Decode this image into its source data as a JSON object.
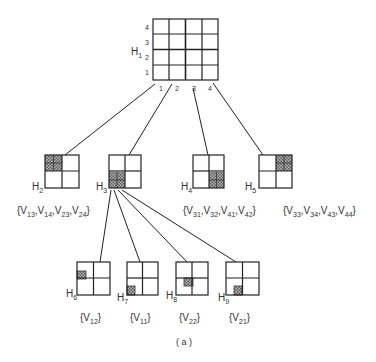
{
  "diagram": {
    "caption": "( a )",
    "root": {
      "label": "H",
      "sub": "1",
      "row_labels": [
        "4",
        "3",
        "2",
        "1"
      ],
      "col_labels": [
        "1",
        "2",
        "3",
        "4"
      ]
    },
    "level2": [
      {
        "label": "H",
        "sub": "2",
        "set": "{V13,V14,V23,V24}"
      },
      {
        "label": "H",
        "sub": "3",
        "set": "{V11,V12,V21,V22}"
      },
      {
        "label": "H",
        "sub": "4",
        "set": "{V31,V32,V41,V42}"
      },
      {
        "label": "H",
        "sub": "5",
        "set": "{V33,V34,V43,V44}"
      }
    ],
    "level3": [
      {
        "label": "H",
        "sub": "6",
        "set": "{V12}"
      },
      {
        "label": "H",
        "sub": "7",
        "set": "{V11}"
      },
      {
        "label": "H",
        "sub": "8",
        "set": "{V22}"
      },
      {
        "label": "H",
        "sub": "9",
        "set": "{V21}"
      }
    ],
    "set_text": {
      "h2": [
        "{V",
        "13",
        ",V",
        "14",
        ",V",
        "23",
        ",V",
        "24",
        "}"
      ],
      "h4": [
        "{V",
        "31",
        ",V",
        "32",
        ",V",
        "41",
        ",V",
        "42",
        "}"
      ],
      "h5": [
        "{V",
        "33",
        ",V",
        "34",
        ",V",
        "43",
        ",V",
        "44",
        "}"
      ],
      "h6": [
        "{V",
        "12",
        "}"
      ],
      "h7": [
        "{V",
        "11",
        "}"
      ],
      "h8": [
        "{V",
        "22",
        "}"
      ],
      "h9": [
        "{V",
        "21",
        "}"
      ]
    },
    "colors": {
      "line": "#222222",
      "hatch": "#777777",
      "background": "#ffffff"
    }
  }
}
